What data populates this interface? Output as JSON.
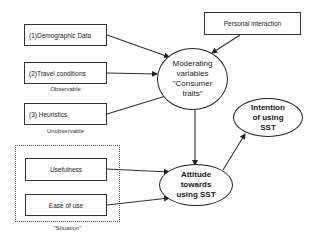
{
  "inputs": {
    "demographic": "(1)Demographic Data",
    "travel": "(2)Travel conditions",
    "heuristics": "(3) Heuristics",
    "personal": "Personal interaction",
    "usefulness": "Usefulness",
    "ease": "Ease of use"
  },
  "labels": {
    "observable": "Observable",
    "unobservable": "Unobservable",
    "situation": "\"Situation\""
  },
  "nodes": {
    "moderating": "Moderating\nvariables\n\"Consumer\ntraits\"",
    "attitude": "Attitude\ntowards\nusing SST",
    "intention": "Intention\nof using\nSST"
  },
  "edges": [
    {
      "from": "(1)Demographic Data",
      "to": "Moderating variables"
    },
    {
      "from": "(2)Travel conditions",
      "to": "Moderating variables"
    },
    {
      "from": "(3) Heuristics",
      "to": "Moderating variables"
    },
    {
      "from": "Personal interaction",
      "to": "Moderating variables"
    },
    {
      "from": "Moderating variables",
      "to": "Attitude towards using SST"
    },
    {
      "from": "Usefulness",
      "to": "Attitude towards using SST"
    },
    {
      "from": "Ease of use",
      "to": "Attitude towards using SST"
    },
    {
      "from": "Attitude towards using SST",
      "to": "Intention of using SST"
    }
  ]
}
